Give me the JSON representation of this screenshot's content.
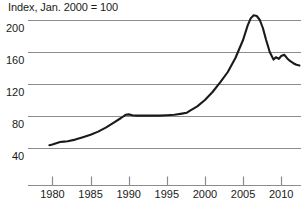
{
  "chart_data": {
    "type": "line",
    "title": "Index, Jan. 2000 = 100",
    "xlabel": "",
    "ylabel": "",
    "xlim": [
      1976.8,
      2012.6
    ],
    "ylim": [
      26,
      212
    ],
    "grid": true,
    "legend": "none",
    "yticks": [
      200,
      160,
      120,
      80,
      40
    ],
    "ytick_labels": [
      "200",
      "160",
      "120",
      "80",
      "40"
    ],
    "xticks": [
      1980,
      1985,
      1990,
      1995,
      2000,
      2005,
      2010
    ],
    "xtick_labels": [
      "1980",
      "1985",
      "1990",
      "1995",
      "2000",
      "2005",
      "2010"
    ],
    "series": [
      {
        "name": "Index",
        "x": [
          1979.6,
          1980.0,
          1980.5,
          1981.0,
          1981.5,
          1982.0,
          1983.0,
          1984.0,
          1985.0,
          1986.0,
          1987.0,
          1988.0,
          1989.0,
          1989.6,
          1990.0,
          1990.5,
          1991.0,
          1992.0,
          1993.0,
          1994.0,
          1995.0,
          1996.0,
          1997.0,
          1997.6,
          1998.0,
          1999.0,
          2000.0,
          2001.0,
          2002.0,
          2003.0,
          2004.0,
          2005.0,
          2005.6,
          2006.0,
          2006.4,
          2006.8,
          2007.2,
          2007.6,
          2008.0,
          2008.5,
          2009.0,
          2009.3,
          2009.7,
          2010.0,
          2010.4,
          2010.8,
          2011.2,
          2011.6,
          2012.0,
          2012.4
        ],
        "y": [
          43.5,
          44.5,
          46.0,
          47.5,
          48.0,
          48.5,
          50.5,
          53.5,
          56.5,
          60.5,
          65.5,
          71.5,
          77.5,
          81.5,
          82.0,
          81.0,
          80.5,
          80.5,
          80.5,
          80.5,
          81.0,
          81.5,
          83.0,
          84.0,
          86.5,
          92.0,
          100.0,
          110.0,
          122.0,
          135.0,
          152.5,
          175.0,
          193.0,
          202.0,
          206.0,
          205.0,
          200.0,
          190.0,
          176.0,
          160.0,
          150.5,
          153.5,
          151.5,
          155.0,
          156.5,
          152.0,
          148.5,
          146.0,
          144.0,
          143.0
        ]
      }
    ],
    "colors": {
      "line": "#1a1a1a",
      "grid": "#8c8c8c",
      "axis": "#8c8c8c",
      "text": "#1a1a1a",
      "background": "#ffffff"
    }
  }
}
